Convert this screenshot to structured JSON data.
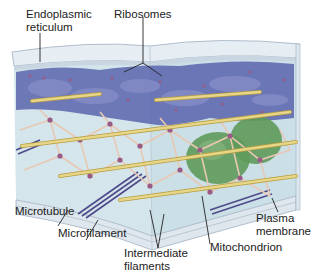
{
  "labels": {
    "er_line1": "Endoplasmic",
    "er_line2": "reticulum",
    "ribosomes": "Ribosomes",
    "microtubule": "Microtubule",
    "microfilament": "Microfilament",
    "intermediate_line1": "Intermediate",
    "intermediate_line2": "filaments",
    "mitochondrion": "Mitochondrion",
    "plasma_line1": "Plasma",
    "plasma_line2": "membrane"
  },
  "colors": {
    "membrane": "#dfe7ee",
    "membrane_edge": "#9fb0c0",
    "cytosol": "#cfe3ea",
    "er": "#5a64ae",
    "er_light": "#8088c4",
    "microtubule": "#d8c36a",
    "intermediate": "#e8c8b4",
    "node": "#9a5a86",
    "mitochondrion": "#5f9a5a",
    "microfilament": "#4e4a8a",
    "leader": "#222222"
  }
}
